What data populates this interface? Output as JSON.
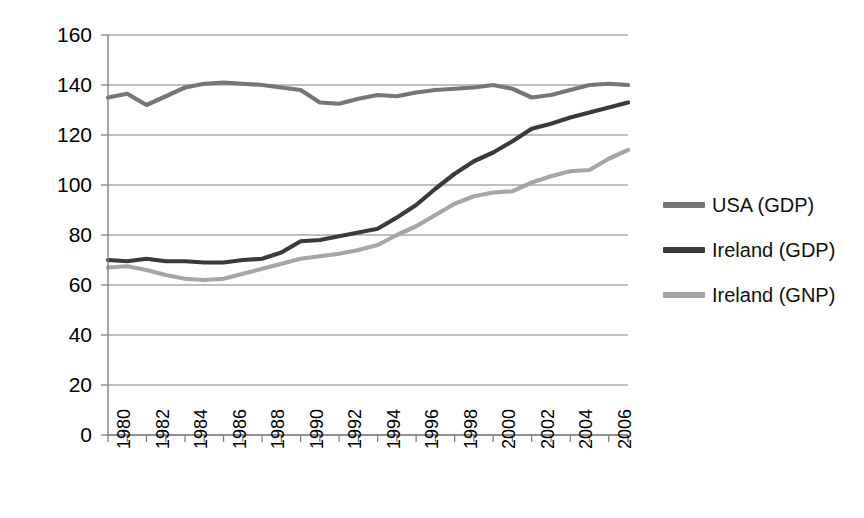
{
  "chart_data": {
    "type": "line",
    "title": "",
    "subtitle": "",
    "xlabel": "",
    "ylabel": "",
    "xlim": [
      1980,
      2007
    ],
    "ylim": [
      0,
      160
    ],
    "grid": true,
    "grid_axis": "y",
    "legend_position": "right",
    "y_ticks": [
      0,
      20,
      40,
      60,
      80,
      100,
      120,
      140,
      160
    ],
    "y_tick_labels": [
      "0",
      "20",
      "40",
      "60",
      "80",
      "100",
      "120",
      "140",
      "160"
    ],
    "x": [
      1980,
      1981,
      1982,
      1983,
      1984,
      1985,
      1986,
      1987,
      1988,
      1989,
      1990,
      1991,
      1992,
      1993,
      1994,
      1995,
      1996,
      1997,
      1998,
      1999,
      2000,
      2001,
      2002,
      2003,
      2004,
      2005,
      2006,
      2007
    ],
    "x_tick_labels": [
      "1980",
      "1982",
      "1984",
      "1986",
      "1988",
      "1990",
      "1992",
      "1994",
      "1996",
      "1998",
      "2000",
      "2002",
      "2004",
      "2006"
    ],
    "x_tick_values": [
      1980,
      1982,
      1984,
      1986,
      1988,
      1990,
      1992,
      1994,
      1996,
      1998,
      2000,
      2002,
      2004,
      2006
    ],
    "series": [
      {
        "name": "USA (GDP)",
        "color": "#767676",
        "values": [
          135,
          136.5,
          132,
          135.5,
          139,
          140.5,
          141,
          140.5,
          140,
          139,
          138,
          133,
          132.5,
          134.5,
          136,
          135.5,
          137,
          138,
          138.5,
          139,
          140,
          138.5,
          135,
          136,
          138,
          140,
          140.5,
          140
        ]
      },
      {
        "name": "Ireland (GDP)",
        "color": "#3a3a3a",
        "values": [
          70,
          69.5,
          70.5,
          69.5,
          69.5,
          69,
          69,
          70,
          70.5,
          73,
          77.5,
          78,
          79.5,
          81,
          82.5,
          87,
          92,
          98.5,
          104.5,
          109.5,
          113,
          117.5,
          122.5,
          124.5,
          127,
          129,
          131,
          133
        ]
      },
      {
        "name": "Ireland (GNP)",
        "color": "#a6a6a6",
        "values": [
          67,
          67.5,
          66,
          64,
          62.5,
          62,
          62.5,
          64.5,
          66.5,
          68.5,
          70.5,
          71.5,
          72.5,
          74,
          76,
          80,
          83.5,
          88,
          92.5,
          95.5,
          97,
          97.5,
          101,
          103.5,
          105.5,
          106,
          110.5,
          114
        ]
      }
    ]
  },
  "legend": {
    "entries": [
      {
        "label": "USA (GDP)",
        "color": "#767676"
      },
      {
        "label": "Ireland (GDP)",
        "color": "#3a3a3a"
      },
      {
        "label": "Ireland (GNP)",
        "color": "#a6a6a6"
      }
    ]
  },
  "axes": {
    "axis_line_color": "#808080",
    "gridline_color": "#808080",
    "tick_color": "#808080"
  }
}
